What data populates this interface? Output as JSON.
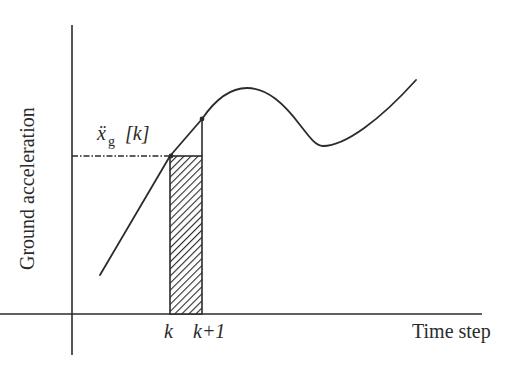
{
  "diagram": {
    "y_axis_label": "Ground acceleration",
    "x_axis_label": "Time step",
    "tick_k": "k",
    "tick_k_plus_1": "k+1",
    "value_label_symbol": "ẍ",
    "value_label_subscript": "g",
    "value_label_index": "[k]",
    "stroke_color": "#2b2b2b",
    "background_color": "#ffffff"
  }
}
